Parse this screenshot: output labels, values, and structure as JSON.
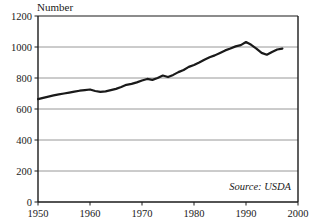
{
  "chart_data": {
    "type": "line",
    "title": "",
    "ylabel": "Number",
    "xlabel": "",
    "source_note": "Source: USDA",
    "grid": true,
    "legend": "none",
    "xlim": [
      1950,
      2000
    ],
    "ylim": [
      0,
      1200
    ],
    "y_ticks": [
      0,
      200,
      400,
      600,
      800,
      1000,
      1200
    ],
    "y_tick_labels": [
      "0",
      "200",
      "400",
      "600",
      "800",
      "1000",
      "1200"
    ],
    "x_ticks": [
      1950,
      1960,
      1970,
      1980,
      1990,
      2000
    ],
    "x_tick_labels": [
      "1950",
      "1960",
      "1970",
      "1980",
      "1990",
      "2000"
    ],
    "line_color": "#1a1a1a",
    "grid_color": "#8c8c8c",
    "axis_color": "#1a1a1a",
    "background_color": "#ffffff",
    "x": [
      1950,
      1951,
      1952,
      1953,
      1954,
      1955,
      1956,
      1957,
      1958,
      1959,
      1960,
      1961,
      1962,
      1963,
      1964,
      1965,
      1966,
      1967,
      1968,
      1969,
      1970,
      1971,
      1972,
      1973,
      1974,
      1975,
      1976,
      1977,
      1978,
      1979,
      1980,
      1981,
      1982,
      1983,
      1984,
      1985,
      1986,
      1987,
      1988,
      1989,
      1990,
      1991,
      1992,
      1993,
      1994,
      1995,
      1996,
      1997
    ],
    "values": [
      664,
      672,
      680,
      688,
      694,
      700,
      706,
      712,
      718,
      722,
      726,
      716,
      710,
      714,
      722,
      730,
      742,
      756,
      762,
      772,
      784,
      794,
      788,
      800,
      816,
      806,
      820,
      838,
      852,
      872,
      884,
      900,
      918,
      934,
      946,
      962,
      978,
      990,
      1004,
      1012,
      1032,
      1014,
      990,
      962,
      950,
      968,
      984,
      990
    ]
  }
}
